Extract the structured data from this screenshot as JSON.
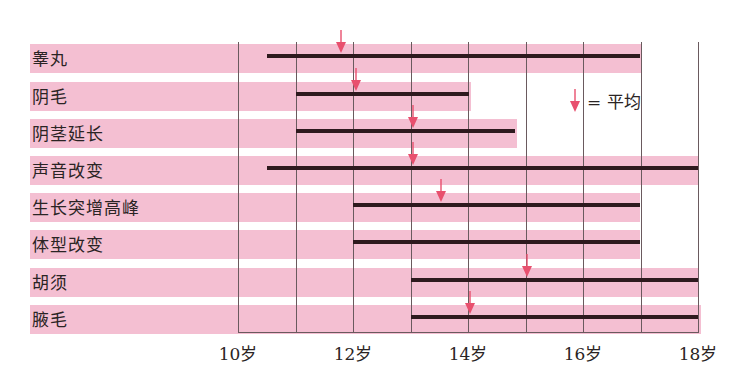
{
  "chart_data": {
    "type": "gantt-range",
    "title": "",
    "xlabel": "",
    "ylabel": "",
    "x_ticks": [
      "10岁",
      "12岁",
      "14岁",
      "16岁",
      "18岁"
    ],
    "xlim": [
      10,
      18
    ],
    "grid": "vertical lines every 1 year",
    "legend": {
      "symbol": "red down arrow",
      "label": "= 平均",
      "position": "upper right"
    },
    "categories": [
      "睾丸",
      "阴毛",
      "阴茎延长",
      "声音改变",
      "生长突增高峰",
      "体型改变",
      "胡须",
      "腋毛"
    ],
    "series": [
      {
        "name": "range_start",
        "values": [
          10.5,
          11,
          11,
          10.5,
          12,
          12,
          13,
          13
        ]
      },
      {
        "name": "range_end",
        "values": [
          17,
          14,
          14.8,
          18,
          17,
          17,
          18,
          18
        ]
      },
      {
        "name": "average",
        "values": [
          11.8,
          12.05,
          13.05,
          13.05,
          13.55,
          null,
          15.05,
          14.05
        ]
      }
    ]
  },
  "colors": {
    "band": "#f4bfd2",
    "bar": "#2e1a1e",
    "arrow": "#e8506e",
    "grid": "#6a5a5e"
  },
  "legend": {
    "label": "= 平均",
    "icon": "down-arrow-icon"
  },
  "ticks": [
    {
      "label": "10岁",
      "x": 238
    },
    {
      "label": "12岁",
      "x": 353
    },
    {
      "label": "14岁",
      "x": 468
    },
    {
      "label": "16岁",
      "x": 583
    },
    {
      "label": "18岁",
      "x": 698
    }
  ],
  "rows": [
    {
      "label": "睾丸",
      "top": 44,
      "band_end": 641,
      "bar_start": 267,
      "bar_end": 640,
      "arrow_x": 341
    },
    {
      "label": "阴毛",
      "top": 82,
      "band_end": 471,
      "bar_start": 296,
      "bar_end": 469,
      "arrow_x": 356
    },
    {
      "label": "阴茎延长",
      "top": 119,
      "band_end": 517,
      "bar_start": 296,
      "bar_end": 515,
      "arrow_x": 413
    },
    {
      "label": "声音改变",
      "top": 156,
      "band_end": 699,
      "bar_start": 267,
      "bar_end": 698,
      "arrow_x": 413
    },
    {
      "label": "生长突增高峰",
      "top": 193,
      "band_end": 640,
      "bar_start": 353,
      "bar_end": 640,
      "arrow_x": 441
    },
    {
      "label": "体型改变",
      "top": 230,
      "band_end": 640,
      "bar_start": 353,
      "bar_end": 640,
      "arrow_x": null
    },
    {
      "label": "胡须",
      "top": 268,
      "band_end": 699,
      "bar_start": 411,
      "bar_end": 698,
      "arrow_x": 527
    },
    {
      "label": "腋毛",
      "top": 305,
      "band_end": 701,
      "bar_start": 411,
      "bar_end": 698,
      "arrow_x": 470
    }
  ]
}
